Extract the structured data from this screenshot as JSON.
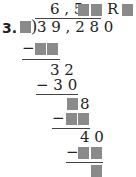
{
  "problem": {
    "number_label": "3.",
    "divisor": "■",
    "dividend": "39,280",
    "dividend_display": "3 9 , 2 8 0",
    "quotient_prefix": "6 , 5",
    "quotient_missing_digits": 2,
    "remainder_label": "R",
    "remainder_missing_digits": 1
  },
  "steps": [
    {
      "minus": "−",
      "missing_digits": 2
    },
    {
      "partial": "3 2"
    },
    {
      "minus_value": "− 3 0"
    },
    {
      "partial_suffix": "8",
      "missing_prefix_digits": 1
    },
    {
      "minus": "−",
      "missing_digits": 2
    },
    {
      "partial": "4 0"
    },
    {
      "minus": "−",
      "missing_digits": 2
    },
    {
      "final_remainder_missing_digits": 1
    }
  ],
  "colors": {
    "blank_box": "#8a8a8a",
    "text": "#222222"
  }
}
